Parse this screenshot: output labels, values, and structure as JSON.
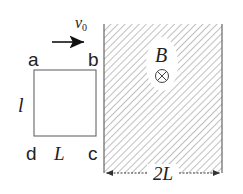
{
  "diagram": {
    "type": "physics-electromagnetic-induction",
    "velocity_label": "v",
    "velocity_subscript": "0",
    "loop": {
      "corner_labels": {
        "top_left": "a",
        "top_right": "b",
        "bottom_left": "d",
        "bottom_right": "c"
      },
      "height_label": "l",
      "width_label": "L"
    },
    "field": {
      "label": "B",
      "direction_symbol": "⊗",
      "direction": "into-page",
      "width_label": "2L"
    },
    "colors": {
      "line": "#555555",
      "hatch": "#8a8a8a",
      "text": "#222222",
      "background": "#ffffff"
    }
  }
}
